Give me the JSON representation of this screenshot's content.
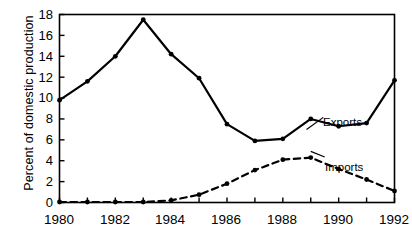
{
  "chart_data": {
    "type": "line",
    "title": "",
    "xlabel": "",
    "ylabel": "Percent of domestic production",
    "xlim": [
      1980,
      1992
    ],
    "ylim": [
      0,
      18
    ],
    "ytick_step": 2,
    "xtick_step": 1,
    "grid": false,
    "legend_position": "inline-annotation",
    "yticks": [
      "0",
      "2",
      "4",
      "6",
      "8",
      "10",
      "12",
      "14",
      "16",
      "18"
    ],
    "xticks": [
      "1980",
      "1982",
      "1984",
      "1986",
      "1988",
      "1990",
      "1992"
    ],
    "xticks_all": [
      1980,
      1981,
      1982,
      1983,
      1984,
      1985,
      1986,
      1987,
      1988,
      1989,
      1990,
      1991,
      1992
    ],
    "x": [
      1980,
      1981,
      1982,
      1983,
      1984,
      1985,
      1986,
      1987,
      1988,
      1989,
      1990,
      1991,
      1992
    ],
    "series": [
      {
        "name": "Exports",
        "style": "solid",
        "marker": "filled-circle",
        "color": "#000000",
        "values": [
          9.8,
          11.6,
          14.0,
          17.5,
          14.2,
          11.9,
          7.5,
          5.9,
          6.1,
          8.0,
          7.3,
          7.6,
          11.7
        ]
      },
      {
        "name": "Imports",
        "style": "dashed",
        "marker": "filled-circle",
        "color": "#000000",
        "values": [
          0.05,
          0.05,
          0.05,
          0.05,
          0.2,
          0.75,
          1.8,
          3.1,
          4.1,
          4.3,
          3.2,
          2.2,
          1.1
        ]
      }
    ],
    "annotations": [
      {
        "text": "Exports",
        "x": 1989.55,
        "y": 8.55
      },
      {
        "text": "Imports",
        "x": 1989.6,
        "y": 4.25
      }
    ]
  }
}
